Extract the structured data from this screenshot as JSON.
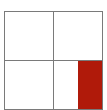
{
  "grid": {
    "rows": 2,
    "cols": 2,
    "line_color": "#7a7a7a",
    "background": "#ffffff"
  },
  "highlight": {
    "cell_row": 1,
    "cell_col": 1,
    "fraction_of_cell_width": 0.5,
    "color": "#b01a0a"
  }
}
